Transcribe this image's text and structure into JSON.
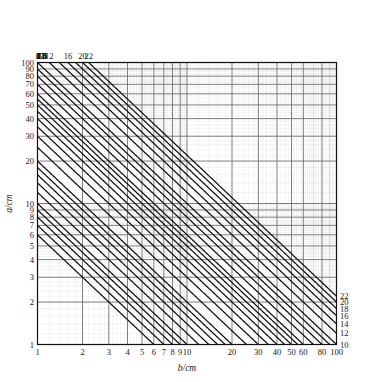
{
  "chart_data": {
    "type": "line",
    "title": "",
    "subtitle": "",
    "xlabel": "b/cm",
    "ylabel": "a/cm",
    "xscale": "log",
    "yscale": "log",
    "xlim": [
      1,
      100
    ],
    "ylim": [
      1,
      100
    ],
    "grid": true,
    "legend_position": "top and right edges (curve parameter labels)",
    "annotations": [],
    "x_ticks_major": [
      1,
      2,
      3,
      4,
      5,
      6,
      7,
      8,
      9,
      10,
      20,
      30,
      40,
      50,
      60,
      80,
      100
    ],
    "x_tick_labels": [
      "1",
      "2",
      "3",
      "4",
      "5",
      "6",
      "7",
      "8",
      "9",
      "10",
      "20",
      "30",
      "40",
      "50",
      "60",
      "80",
      "100"
    ],
    "y_ticks_major": [
      1,
      2,
      3,
      4,
      5,
      6,
      7,
      8,
      9,
      10,
      20,
      30,
      40,
      50,
      60,
      70,
      80,
      90,
      100
    ],
    "y_tick_labels": [
      "1",
      "2",
      "3",
      "4",
      "5",
      "6",
      "7",
      "8",
      "9",
      "10",
      "20",
      "30",
      "40",
      "50",
      "60",
      "70",
      "80",
      "90",
      "100"
    ],
    "y_labels_hidden": [
      "2",
      "3",
      "4",
      "5",
      "6"
    ],
    "curve_parameter_note": "Each curve is the locus a*b = const; it is labelled by its parameter value at the top edge (a = 100) and/or at the right edge (b = 100).",
    "top_labels": [
      "0.6",
      "0.8",
      "1.0",
      "1.4",
      "1.8",
      "2.5",
      "3.5",
      "4.5",
      "5.5",
      "7",
      "9",
      "12",
      "16",
      "20",
      "22"
    ],
    "right_labels": [
      "22",
      "20",
      "18",
      "16",
      "14",
      "12",
      "10",
      "9",
      "8",
      "7",
      "6",
      "5",
      "4",
      "3.5",
      "3",
      "2.5",
      "2",
      "1.8",
      "1.6",
      "1.4",
      "1.2",
      "1.0",
      "0.9",
      "0.7",
      "0.6"
    ],
    "series": [
      {
        "name": "0.6",
        "value": 0.6
      },
      {
        "name": "0.7",
        "value": 0.7
      },
      {
        "name": "0.8",
        "value": 0.8
      },
      {
        "name": "0.9",
        "value": 0.9
      },
      {
        "name": "1.0",
        "value": 1.0
      },
      {
        "name": "1.2",
        "value": 1.2
      },
      {
        "name": "1.4",
        "value": 1.4
      },
      {
        "name": "1.6",
        "value": 1.6
      },
      {
        "name": "1.8",
        "value": 1.8
      },
      {
        "name": "2",
        "value": 2.0
      },
      {
        "name": "2.5",
        "value": 2.5
      },
      {
        "name": "3",
        "value": 3.0
      },
      {
        "name": "3.5",
        "value": 3.5
      },
      {
        "name": "4",
        "value": 4.0
      },
      {
        "name": "4.5",
        "value": 4.5
      },
      {
        "name": "5",
        "value": 5.0
      },
      {
        "name": "5.5",
        "value": 5.5
      },
      {
        "name": "6",
        "value": 6.0
      },
      {
        "name": "7",
        "value": 7.0
      },
      {
        "name": "8",
        "value": 8.0
      },
      {
        "name": "9",
        "value": 9.0
      },
      {
        "name": "10",
        "value": 10.0
      },
      {
        "name": "12",
        "value": 12.0
      },
      {
        "name": "14",
        "value": 14.0
      },
      {
        "name": "16",
        "value": 16.0
      },
      {
        "name": "18",
        "value": 18.0
      },
      {
        "name": "20",
        "value": 20.0
      },
      {
        "name": "22",
        "value": 22.0
      }
    ]
  },
  "colors": {
    "curve": "#111111",
    "grid_major": "#6e6e6e",
    "grid_minor": "#b9b9b9",
    "frame": "#111111",
    "text": "#181818",
    "background": "#ffffff"
  },
  "axes": {
    "x_title": "b/cm",
    "y_title": "a/cm"
  }
}
